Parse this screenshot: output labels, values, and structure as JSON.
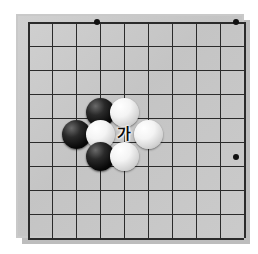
{
  "figure": {
    "kind": "go-board-diagram",
    "background_color": "#ffffff",
    "board_color": "#c6c6c6",
    "line_color": "#2b2b2b"
  },
  "board": {
    "origin_x": 28,
    "origin_y": 22,
    "cell": 24,
    "cols": 9,
    "rows": 9,
    "width_px": 208,
    "height_px": 203,
    "star_points": [
      {
        "col": 3,
        "row": 0,
        "x": 97,
        "y": 22
      },
      {
        "col": 8,
        "row": 0,
        "x": 236,
        "y": 22
      },
      {
        "col": 8,
        "row": 5,
        "x": 236,
        "y": 157
      }
    ]
  },
  "stones": [
    {
      "color": "black",
      "col": 3,
      "row": 3.7,
      "x": 100,
      "y": 112,
      "label": "black-stone-upper"
    },
    {
      "color": "white",
      "col": 4,
      "row": 3.7,
      "x": 124,
      "y": 112,
      "label": "white-stone-upper"
    },
    {
      "color": "black",
      "col": 2,
      "row": 4.6,
      "x": 76,
      "y": 134,
      "label": "black-stone-left"
    },
    {
      "color": "white",
      "col": 3,
      "row": 4.6,
      "x": 100,
      "y": 134,
      "label": "white-stone-center"
    },
    {
      "color": "white",
      "col": 5,
      "row": 4.6,
      "x": 148,
      "y": 134,
      "label": "white-stone-right"
    },
    {
      "color": "black",
      "col": 3,
      "row": 5.5,
      "x": 100,
      "y": 156,
      "label": "black-stone-lower"
    },
    {
      "color": "white",
      "col": 4,
      "row": 5.5,
      "x": 124,
      "y": 156,
      "label": "white-stone-lower"
    }
  ],
  "annotations": [
    {
      "text": "가",
      "x": 124,
      "y": 134,
      "name": "point-label-ga"
    }
  ]
}
